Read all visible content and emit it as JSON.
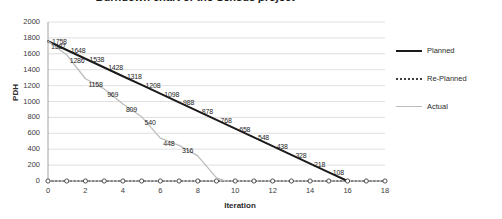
{
  "chart_data": {
    "type": "line",
    "title": "Burndown chart of the Sensus project",
    "xlabel": "Iteration",
    "ylabel": "PDH",
    "xlim": [
      0,
      18
    ],
    "ylim": [
      0,
      2000
    ],
    "ytick_step": 200,
    "xtick_step": 2,
    "grid": true,
    "legend_position": "right",
    "x": [
      0,
      1,
      2,
      3,
      4,
      5,
      6,
      7,
      8,
      9,
      10,
      11,
      12,
      13,
      14,
      15,
      16,
      17,
      18
    ],
    "yticks": [
      0,
      200,
      400,
      600,
      800,
      1000,
      1200,
      1400,
      1600,
      1800,
      2000
    ],
    "xticks": [
      0,
      2,
      4,
      6,
      8,
      10,
      12,
      14,
      16,
      18
    ],
    "series": [
      {
        "name": "Planned",
        "style": "solid",
        "color": "#1a1a1a",
        "x": [
          0,
          1,
          2,
          3,
          4,
          5,
          6,
          7,
          8,
          9,
          10,
          11,
          12,
          13,
          14,
          15,
          16
        ],
        "values": [
          1758,
          1648,
          1538,
          1428,
          1318,
          1208,
          1098,
          988,
          878,
          768,
          658,
          548,
          438,
          328,
          218,
          108,
          0
        ],
        "labels": [
          1758,
          1648,
          1538,
          1428,
          1318,
          1208,
          1098,
          988,
          878,
          768,
          658,
          548,
          438,
          328,
          218,
          108
        ]
      },
      {
        "name": "Re-Planned",
        "style": "dotted",
        "color": "#3d3d3d",
        "x": [
          0,
          1,
          2,
          3,
          4,
          5,
          6,
          7,
          8,
          9,
          10,
          11,
          12,
          13,
          14,
          15,
          16,
          17,
          18
        ],
        "values": [
          0,
          0,
          0,
          0,
          0,
          0,
          0,
          0,
          0,
          0,
          0,
          0,
          0,
          0,
          0,
          0,
          0,
          0,
          0
        ],
        "labels": []
      },
      {
        "name": "Actual",
        "style": "solid-light",
        "color": "#bdbdbd",
        "x": [
          0,
          1,
          2,
          3,
          4,
          5,
          6,
          7,
          8,
          9,
          9.5
        ],
        "values": [
          1758,
          1587,
          1286,
          1158,
          969,
          809,
          540,
          448,
          316,
          40,
          0
        ],
        "labels": [
          1587,
          1286,
          1158,
          969,
          809,
          540,
          448,
          316
        ]
      }
    ]
  },
  "legend": {
    "items": [
      {
        "label": "Planned"
      },
      {
        "label": "Re-Planned"
      },
      {
        "label": "Actual"
      }
    ]
  },
  "axis": {
    "y_title": "PDH",
    "x_title": "Iteration"
  },
  "ytick_labels": [
    "2000",
    "1800",
    "1600",
    "1400",
    "1200",
    "1000",
    "800",
    "600",
    "400",
    "200",
    "0"
  ],
  "xtick_labels": [
    "0",
    "2",
    "4",
    "6",
    "8",
    "10",
    "12",
    "14",
    "16",
    "18"
  ],
  "planned_labels": [
    "1758",
    "1648",
    "1538",
    "1428",
    "1318",
    "1208",
    "1098",
    "988",
    "878",
    "768",
    "658",
    "548",
    "438",
    "328",
    "218",
    "108"
  ],
  "actual_labels": [
    "1587",
    "1286",
    "1158",
    "969",
    "809",
    "540",
    "448",
    "316"
  ]
}
